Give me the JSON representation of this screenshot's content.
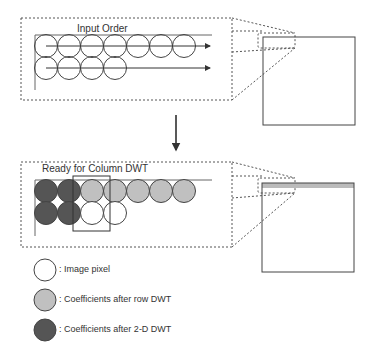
{
  "top_panel": {
    "label": "Input Order",
    "row1_count": 7,
    "row2_count": 4
  },
  "bottom_panel": {
    "label": "Ready for Column DWT"
  },
  "legend": [
    {
      "label": ": Image pixel",
      "color": "#ffffff"
    },
    {
      "label": ": Coefficients after row DWT",
      "color": "#c0c0c0"
    },
    {
      "label": ": Coefficients after 2-D DWT",
      "color": "#555555"
    }
  ],
  "colors": {
    "stroke": "#444444",
    "gray": "#c0c0c0",
    "dark": "#555555"
  }
}
